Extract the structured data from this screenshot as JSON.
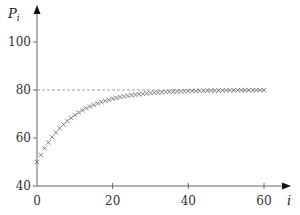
{
  "chart_data": {
    "type": "scatter",
    "title": "",
    "xlabel": "i",
    "ylabel": "P_i",
    "xlim": [
      0,
      60
    ],
    "ylim": [
      40,
      100
    ],
    "x_ticks": [
      0,
      20,
      40,
      60
    ],
    "y_ticks": [
      40,
      60,
      80,
      100
    ],
    "grid": false,
    "legend": null,
    "marker": "x",
    "asymptote": {
      "y": 80,
      "style": "dashed",
      "color": "#888888"
    },
    "formula_estimate": "P_i = 80 - 30 * 0.9^i",
    "series": [
      {
        "name": "P_i",
        "x": [
          0,
          1,
          2,
          3,
          4,
          5,
          6,
          7,
          8,
          9,
          10,
          11,
          12,
          13,
          14,
          15,
          16,
          17,
          18,
          19,
          20,
          21,
          22,
          23,
          24,
          25,
          26,
          27,
          28,
          29,
          30,
          31,
          32,
          33,
          34,
          35,
          36,
          37,
          38,
          39,
          40,
          41,
          42,
          43,
          44,
          45,
          46,
          47,
          48,
          49,
          50,
          51,
          52,
          53,
          54,
          55,
          56,
          57,
          58,
          59,
          60
        ],
        "values": [
          50.0,
          53.0,
          55.7,
          58.13,
          60.32,
          62.29,
          64.06,
          65.65,
          67.09,
          68.38,
          69.54,
          70.59,
          71.53,
          72.38,
          73.14,
          73.82,
          74.44,
          75.0,
          75.5,
          75.95,
          76.35,
          76.72,
          77.05,
          77.34,
          77.61,
          77.85,
          78.06,
          78.26,
          78.43,
          78.59,
          78.73,
          78.86,
          78.97,
          79.08,
          79.17,
          79.25,
          79.32,
          79.39,
          79.45,
          79.51,
          79.56,
          79.6,
          79.64,
          79.68,
          79.71,
          79.74,
          79.77,
          79.79,
          79.81,
          79.83,
          79.85,
          79.87,
          79.88,
          79.89,
          79.9,
          79.91,
          79.92,
          79.93,
          79.94,
          79.94,
          79.95
        ]
      }
    ]
  },
  "colors": {
    "axis": "#666666",
    "marker": "#555555",
    "asymptote": "#999999",
    "text": "#333333"
  }
}
